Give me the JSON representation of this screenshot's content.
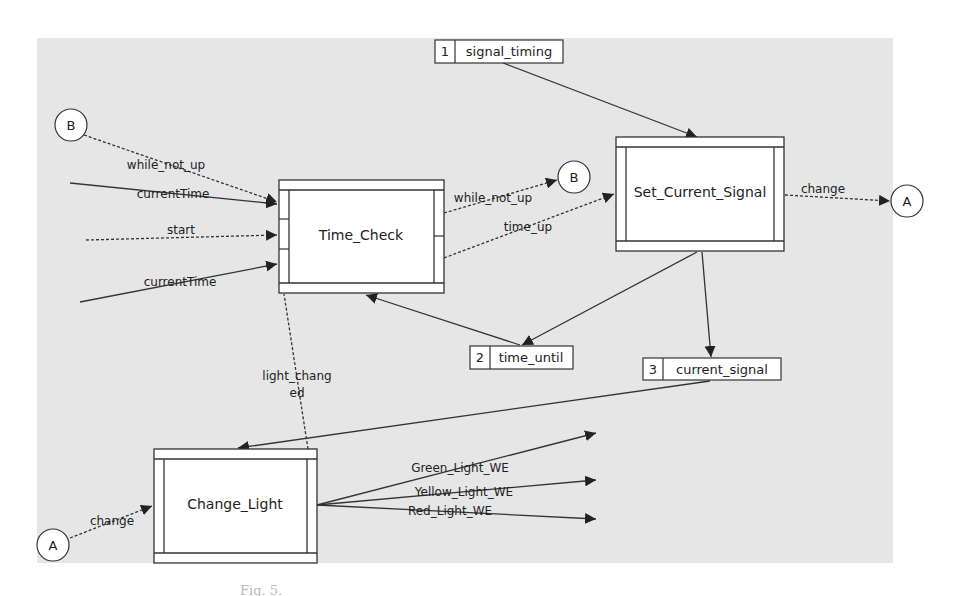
{
  "diagram": {
    "type": "data-flow-diagram",
    "background_color": "#e6e6e6",
    "processes": [
      {
        "id": "time_check",
        "label": "Time_Check"
      },
      {
        "id": "set_current_signal",
        "label": "Set_Current_Signal"
      },
      {
        "id": "change_light",
        "label": "Change_Light"
      }
    ],
    "stores": [
      {
        "id": "signal_timing",
        "number": "1",
        "label": "signal_timing"
      },
      {
        "id": "time_until",
        "number": "2",
        "label": "time_until"
      },
      {
        "id": "current_signal",
        "number": "3",
        "label": "current_signal"
      }
    ],
    "connectors": [
      {
        "id": "b_in",
        "label": "B"
      },
      {
        "id": "b_out",
        "label": "B"
      },
      {
        "id": "a_out",
        "label": "A"
      },
      {
        "id": "a_in",
        "label": "A"
      }
    ],
    "flows": [
      {
        "id": "f1",
        "label": "while_not_up",
        "from": "B",
        "to": "Time_Check",
        "style": "dashed"
      },
      {
        "id": "f2",
        "label": "currentTime",
        "from": "external",
        "to": "Time_Check",
        "style": "solid"
      },
      {
        "id": "f3",
        "label": "start",
        "from": "external",
        "to": "Time_Check",
        "style": "dashed"
      },
      {
        "id": "f4",
        "label": "currentTime",
        "from": "external",
        "to": "Time_Check",
        "style": "solid"
      },
      {
        "id": "f5",
        "label": "while_not_up",
        "from": "Time_Check",
        "to": "B",
        "style": "dashed"
      },
      {
        "id": "f6",
        "label": "time_up",
        "from": "Time_Check",
        "to": "Set_Current_Signal",
        "style": "dashed"
      },
      {
        "id": "f7",
        "label": "change",
        "from": "Set_Current_Signal",
        "to": "A",
        "style": "dashed"
      },
      {
        "id": "f8",
        "label": "light_chang ed",
        "label_line1": "light_chang",
        "label_line2": "ed",
        "from": "Change_Light",
        "to": "Time_Check",
        "style": "dashed"
      },
      {
        "id": "f9",
        "label": "change",
        "from": "A",
        "to": "Change_Light",
        "style": "dashed"
      },
      {
        "id": "f10",
        "label": "Green_Light_WE",
        "from": "Change_Light",
        "to": "external",
        "style": "solid"
      },
      {
        "id": "f11",
        "label": "Yellow_Light_WE",
        "from": "Change_Light",
        "to": "external",
        "style": "solid"
      },
      {
        "id": "f12",
        "label": "Red_Light_WE",
        "from": "Change_Light",
        "to": "external",
        "style": "solid"
      }
    ],
    "caption": "Fig. 5."
  }
}
